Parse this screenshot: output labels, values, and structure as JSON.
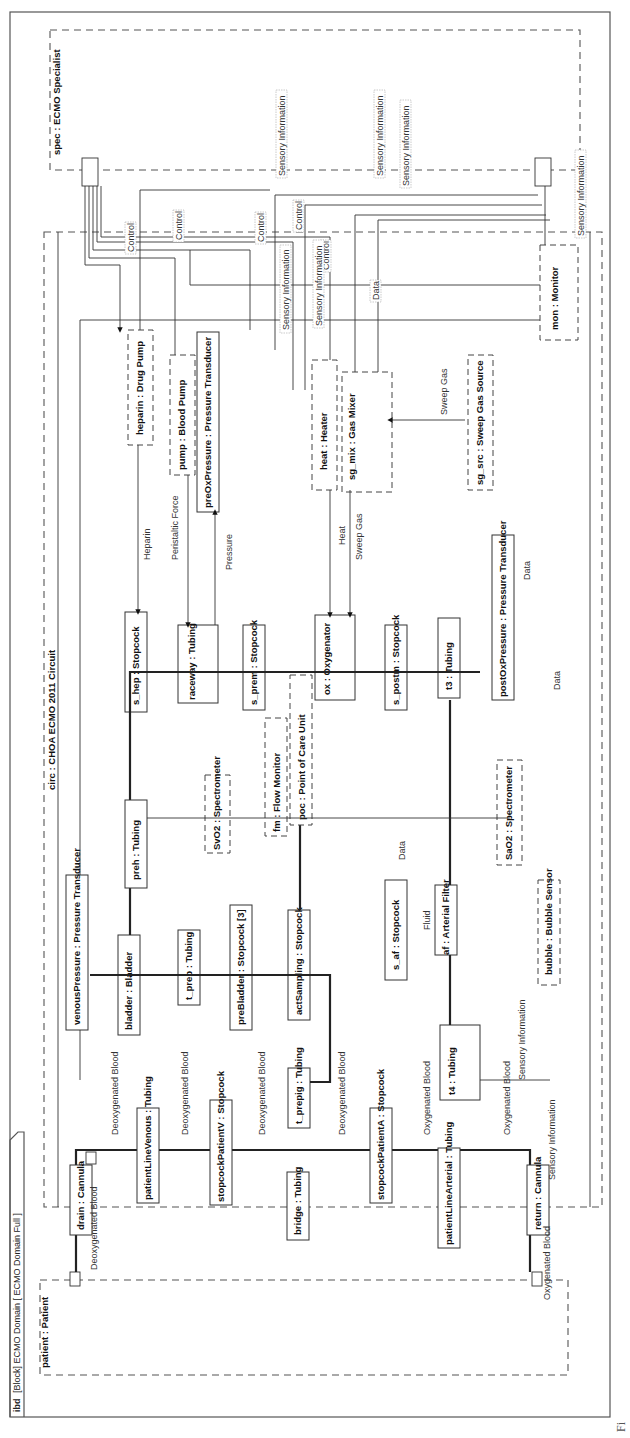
{
  "diagram": {
    "frame_tab": {
      "kind": "ibd",
      "rest": "[Block] ECMO Domain [ ECMO Domain Full ]"
    },
    "caption_fragment": "Fi",
    "outer_parts": [
      {
        "id": "spec",
        "label": "spec : ECMO Specialist"
      },
      {
        "id": "circ",
        "label": "circ : CHOA ECMO 2011 Circuit"
      },
      {
        "id": "patient",
        "label": "patient : Patient"
      }
    ],
    "blocks": [
      {
        "id": "drain",
        "label": "drain : Cannula"
      },
      {
        "id": "patientLineVenous",
        "label": "patientLineVenous : Tubing"
      },
      {
        "id": "stopcockPatientV",
        "label": "stopcockPatientV : Stopcock"
      },
      {
        "id": "bridge",
        "label": "bridge : Tubing"
      },
      {
        "id": "stopcockPatientA",
        "label": "stopcockPatientA : Stopcock"
      },
      {
        "id": "patientLineArterial",
        "label": "patientLineArterial : Tubing"
      },
      {
        "id": "return",
        "label": "return : Cannula"
      },
      {
        "id": "t_prepig",
        "label": "t_prepig : Tubing"
      },
      {
        "id": "t4",
        "label": "t4 : Tubing"
      },
      {
        "id": "venousPressure",
        "label": "venousPressure : Pressure Transducer"
      },
      {
        "id": "bladder",
        "label": "bladder : Bladder"
      },
      {
        "id": "t_preb",
        "label": "t_preb : Tubing"
      },
      {
        "id": "preBladder",
        "label": "preBladder : Stopcock [3]"
      },
      {
        "id": "actSampling",
        "label": "actSampling : Stopcock"
      },
      {
        "id": "s_af",
        "label": "s_af : Stopcock"
      },
      {
        "id": "af",
        "label": "af : Arterial Filter"
      },
      {
        "id": "bubble",
        "label": "bubble : Bubble Sensor"
      },
      {
        "id": "preh",
        "label": "preh : Tubing"
      },
      {
        "id": "SvO2",
        "label": "SvO2 : Spectrometer"
      },
      {
        "id": "fm",
        "label": "fm : Flow Monitor"
      },
      {
        "id": "poc",
        "label": "poc : Point of Care Unit"
      },
      {
        "id": "SaO2",
        "label": "SaO2 : Spectrometer"
      },
      {
        "id": "s_hep",
        "label": "s_hep : Stopcock"
      },
      {
        "id": "raceway",
        "label": "raceway : Tubing"
      },
      {
        "id": "s_prem",
        "label": "s_prem : Stopcock"
      },
      {
        "id": "ox",
        "label": "ox : Oxygenator"
      },
      {
        "id": "s_postm",
        "label": "s_postm : Stopcock"
      },
      {
        "id": "t3",
        "label": "t3 : Tubing"
      },
      {
        "id": "postOxPressure",
        "label": "postOxPressure : Pressure Transducer"
      },
      {
        "id": "heparin",
        "label": "heparin : Drug Pump"
      },
      {
        "id": "pump",
        "label": "pump : Blood Pump"
      },
      {
        "id": "preOxPressure",
        "label": "preOxPressure : Pressure Transducer"
      },
      {
        "id": "heat",
        "label": "heat : Heater"
      },
      {
        "id": "sg_mix",
        "label": "sg_mix : Gas Mixer"
      },
      {
        "id": "sg_src",
        "label": "sg_src : Sweep Gas Source"
      },
      {
        "id": "mon",
        "label": "mon : Monitor"
      }
    ],
    "flow_labels": {
      "deoxy": "Deoxygenated Blood",
      "oxy": "Oxygenated Blood",
      "control": "Control",
      "sensory": "Sensory Information",
      "data": "Data",
      "pressure": "Pressure",
      "heparin": "Heparin",
      "peristaltic": "Peristaltic Force",
      "heat": "Heat",
      "sweep": "Sweep Gas",
      "fluid": "Fluid"
    }
  }
}
